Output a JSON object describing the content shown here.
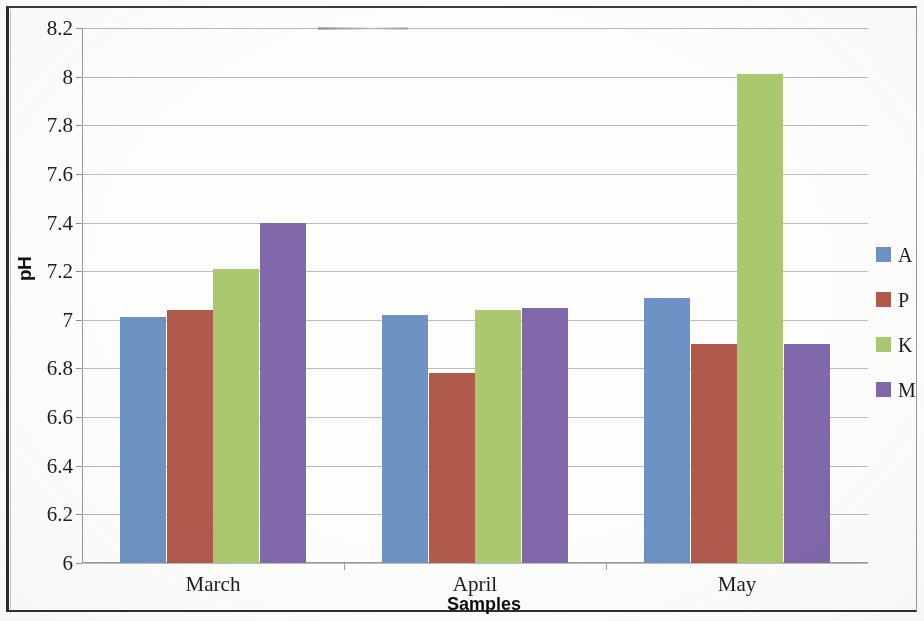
{
  "chart_data": {
    "type": "bar",
    "title": "",
    "xlabel": "Samples",
    "ylabel": "pH",
    "categories": [
      "March",
      "April",
      "May"
    ],
    "series": [
      {
        "name": "A",
        "color": "#6d92c3",
        "values": [
          7.01,
          7.02,
          7.09
        ]
      },
      {
        "name": "P",
        "color": "#b05a4b",
        "values": [
          7.04,
          6.78,
          6.9
        ]
      },
      {
        "name": "K",
        "color": "#aac96f",
        "values": [
          7.21,
          7.04,
          8.01
        ]
      },
      {
        "name": "M",
        "color": "#8168ab",
        "values": [
          7.4,
          7.05,
          6.9
        ]
      }
    ],
    "ylim": [
      6,
      8.2
    ],
    "ytick_labels": [
      "8.2",
      "8",
      "7.8",
      "7.6",
      "7.4",
      "7.2",
      "7",
      "6.8",
      "6.6",
      "6.4",
      "6.2",
      "6"
    ],
    "ytick_values": [
      8.2,
      8,
      7.8,
      7.6,
      7.4,
      7.2,
      7,
      6.8,
      6.6,
      6.4,
      6.2,
      6
    ],
    "grid": true,
    "legend_position": "right",
    "legend_entries": [
      "A",
      "P",
      "K",
      "M"
    ]
  }
}
